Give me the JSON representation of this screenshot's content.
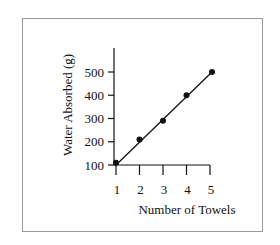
{
  "chart_data": {
    "type": "scatter",
    "title": "",
    "xlabel": "Number of Towels",
    "ylabel": "Water Absorbed (g)",
    "x": [
      1,
      2,
      3,
      4,
      5
    ],
    "series": [
      {
        "name": "Water Absorbed",
        "values": [
          110,
          210,
          290,
          400,
          500
        ],
        "marker": "circle"
      }
    ],
    "trendline": {
      "type": "linear",
      "from": [
        1,
        100
      ],
      "to": [
        5,
        500
      ]
    },
    "x_ticks": [
      "1",
      "2",
      "3",
      "4",
      "5"
    ],
    "y_ticks": [
      "100",
      "200",
      "300",
      "400",
      "500"
    ],
    "xlim": [
      1,
      5
    ],
    "ylim": [
      100,
      530
    ],
    "grid": false,
    "legend": null
  },
  "colors": {
    "ink": "#111111",
    "frame": "#9a9a9a",
    "background": "#ffffff"
  }
}
